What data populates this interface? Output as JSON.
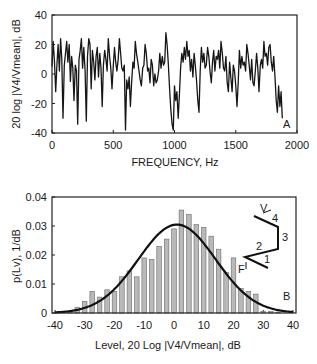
{
  "chart_data": [
    {
      "id": "A",
      "type": "line",
      "panel_label": "A",
      "title": "",
      "xlabel": "FREQUENCY,  Hz",
      "ylabel": "20 log |V4/Vmean|, dB",
      "xlim": [
        0,
        2000
      ],
      "ylim": [
        -40,
        40
      ],
      "xticks": [
        0,
        500,
        1000,
        1500,
        2000
      ],
      "yticks": [
        -40,
        -20,
        0,
        20,
        40
      ],
      "xtick_labels": [
        "0",
        "500",
        "1000",
        "1500",
        "2000"
      ],
      "ytick_labels": [
        "-40",
        "-20",
        "0",
        "20",
        "40"
      ],
      "grid": false,
      "series": [
        {
          "name": "level",
          "x": [
            0,
            10,
            20,
            30,
            40,
            50,
            60,
            70,
            80,
            90,
            100,
            110,
            120,
            130,
            140,
            150,
            160,
            170,
            180,
            190,
            200,
            210,
            220,
            230,
            240,
            250,
            260,
            270,
            280,
            290,
            300,
            310,
            320,
            330,
            340,
            350,
            360,
            370,
            380,
            390,
            400,
            410,
            420,
            430,
            440,
            450,
            460,
            470,
            480,
            490,
            500,
            510,
            520,
            530,
            540,
            550,
            560,
            570,
            580,
            590,
            600,
            610,
            620,
            630,
            640,
            650,
            660,
            670,
            680,
            690,
            700,
            710,
            720,
            730,
            740,
            750,
            760,
            770,
            780,
            790,
            800,
            810,
            820,
            830,
            840,
            850,
            860,
            870,
            880,
            890,
            900,
            910,
            920,
            930,
            940,
            950,
            960,
            970,
            980,
            990,
            1000,
            1010,
            1020,
            1030,
            1040,
            1050,
            1060,
            1070,
            1080,
            1090,
            1100,
            1110,
            1120,
            1130,
            1140,
            1150,
            1160,
            1170,
            1180,
            1190,
            1200,
            1210,
            1220,
            1230,
            1240,
            1250,
            1260,
            1270,
            1280,
            1290,
            1300,
            1310,
            1320,
            1330,
            1340,
            1350,
            1360,
            1370,
            1380,
            1390,
            1400,
            1410,
            1420,
            1430,
            1440,
            1450,
            1460,
            1470,
            1480,
            1490,
            1500,
            1510,
            1520,
            1530,
            1540,
            1550,
            1560,
            1570,
            1580,
            1590,
            1600,
            1610,
            1620,
            1630,
            1640,
            1650,
            1660,
            1670,
            1680,
            1690,
            1700,
            1710,
            1720,
            1730,
            1740,
            1750,
            1760,
            1770,
            1780,
            1790,
            1800,
            1810,
            1820,
            1830,
            1840,
            1850,
            1860,
            1870,
            1880,
            1890,
            1900,
            1910,
            1920,
            1930,
            1940,
            1950,
            1960,
            1970,
            1980,
            1990,
            2000
          ],
          "y": [
            5,
            22,
            8,
            -12,
            6,
            20,
            2,
            24,
            10,
            -30,
            6,
            14,
            22,
            8,
            20,
            -5,
            12,
            4,
            -18,
            6,
            2,
            -34,
            10,
            16,
            24,
            4,
            18,
            2,
            -32,
            12,
            24,
            20,
            -10,
            16,
            8,
            -4,
            12,
            18,
            -2,
            14,
            4,
            -22,
            6,
            16,
            10,
            2,
            24,
            12,
            4,
            -10,
            6,
            18,
            8,
            2,
            10,
            24,
            14,
            4,
            2,
            6,
            -38,
            -4,
            -10,
            -2,
            -22,
            -6,
            8,
            4,
            22,
            14,
            8,
            2,
            -4,
            -8,
            4,
            6,
            20,
            14,
            2,
            4,
            -6,
            10,
            6,
            -8,
            0,
            -6,
            -4,
            2,
            14,
            4,
            12,
            6,
            8,
            28,
            20,
            6,
            -10,
            -24,
            -34,
            -38,
            -8,
            -18,
            -12,
            -30,
            -14,
            4,
            14,
            8,
            18,
            10,
            22,
            12,
            16,
            2,
            10,
            -2,
            14,
            6,
            -4,
            -18,
            -26,
            2,
            18,
            8,
            14,
            4,
            6,
            18,
            12,
            2,
            -6,
            8,
            16,
            2,
            12,
            10,
            16,
            4,
            22,
            14,
            4,
            2,
            12,
            -6,
            -12,
            8,
            -2,
            -12,
            6,
            2,
            -8,
            -22,
            -6,
            16,
            4,
            12,
            6,
            8,
            2,
            20,
            14,
            6,
            -4,
            10,
            -6,
            -8,
            2,
            14,
            4,
            -12,
            6,
            10,
            4,
            22,
            12,
            14,
            6,
            18,
            20,
            8,
            2,
            12,
            -2,
            -18,
            -26,
            -8,
            -22,
            -12,
            -30
          ]
        }
      ]
    },
    {
      "id": "B",
      "type": "bar",
      "panel_label": "B",
      "title": "",
      "xlabel": "Level,  20 Log |V4/Vmean|, dB",
      "ylabel": "p(Lv), 1/dB",
      "xlim": [
        -40,
        40
      ],
      "ylim": [
        0,
        0.04
      ],
      "xticks": [
        -40,
        -30,
        -20,
        -10,
        0,
        10,
        20,
        30,
        40
      ],
      "yticks": [
        0,
        0.01,
        0.02,
        0.03,
        0.04
      ],
      "xtick_labels": [
        "-40",
        "-30",
        "-20",
        "-10",
        "0",
        "10",
        "20",
        "30",
        "40"
      ],
      "ytick_labels": [
        "0",
        "0.01",
        "0.02",
        "0.03",
        "0.04"
      ],
      "grid": false,
      "categories": [
        -37.5,
        -35,
        -32.5,
        -30,
        -27.5,
        -25,
        -22.5,
        -20,
        -17.5,
        -15,
        -12.5,
        -10,
        -7.5,
        -5,
        -2.5,
        0,
        2.5,
        5,
        7.5,
        10,
        12.5,
        15,
        17.5,
        20,
        22.5,
        25,
        27.5,
        30,
        32.5,
        35
      ],
      "series": [
        {
          "name": "histogram",
          "values": [
            0.0003,
            0.0005,
            0.002,
            0.004,
            0.0075,
            0.0055,
            0.008,
            0.0075,
            0.0125,
            0.0145,
            0.0125,
            0.019,
            0.0185,
            0.023,
            0.0255,
            0.029,
            0.0355,
            0.034,
            0.0305,
            0.0295,
            0.0265,
            0.022,
            0.014,
            0.019,
            0.0085,
            0.0075,
            0.0065,
            0.0005,
            0.0005,
            0.0003
          ]
        },
        {
          "name": "gaussian fit",
          "type": "line",
          "mean": 1,
          "peak": 0.0305,
          "sigma": 13
        }
      ],
      "inset": {
        "labels": [
          "F",
          "1",
          "2",
          "3",
          "4",
          "V"
        ]
      }
    }
  ]
}
